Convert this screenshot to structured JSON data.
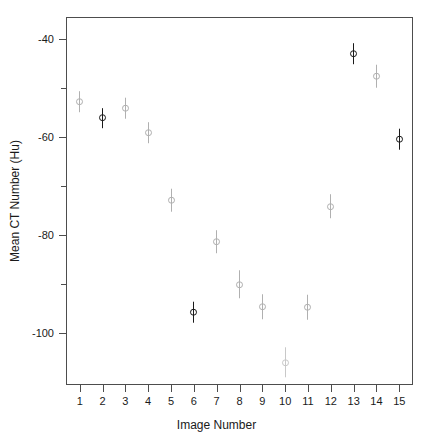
{
  "chart_data": {
    "type": "scatter",
    "title": "",
    "xlabel": "Image Number",
    "ylabel": "Mean CT Number (Hu)",
    "grid": false,
    "legend": null,
    "xlim": [
      0.4,
      15.6
    ],
    "ylim": [
      -110.5,
      -35.5
    ],
    "x_tick_labels": [
      "1",
      "2",
      "3",
      "4",
      "5",
      "6",
      "7",
      "8",
      "9",
      "10",
      "11",
      "12",
      "13",
      "14",
      "15"
    ],
    "x_ticks": [
      1,
      2,
      3,
      4,
      5,
      6,
      7,
      8,
      9,
      10,
      11,
      12,
      13,
      14,
      15
    ],
    "y_tick_labels": [
      "-40",
      "",
      "-60",
      "",
      "-80",
      "",
      "-100"
    ],
    "y_ticks": [
      -40,
      -50,
      -60,
      -70,
      -80,
      -90,
      -100
    ],
    "marker": "open-circle-with-errorbar",
    "x": [
      1,
      2,
      3,
      4,
      5,
      6,
      7,
      8,
      9,
      10,
      11,
      12,
      13,
      14,
      15
    ],
    "values": [
      -52.8,
      -56.1,
      -54.1,
      -59.1,
      -72.8,
      -95.7,
      -81.3,
      -90.0,
      -94.6,
      -105.9,
      -94.6,
      -74.1,
      -43.0,
      -47.6,
      -60.4
    ],
    "yerr": [
      2.2,
      2.0,
      2.1,
      2.2,
      2.3,
      2.1,
      2.4,
      2.8,
      2.6,
      3.0,
      2.5,
      2.4,
      2.2,
      2.3,
      2.1
    ],
    "point_colors": [
      "#b0b0b0",
      "#1a1a1a",
      "#b0b0b0",
      "#b0b0b0",
      "#b0b0b0",
      "#1a1a1a",
      "#b0b0b0",
      "#b0b0b0",
      "#b0b0b0",
      "#c8c8c8",
      "#b0b0b0",
      "#b0b0b0",
      "#1a1a1a",
      "#b0b0b0",
      "#1a1a1a"
    ],
    "axis_color": "#4d4d4d",
    "text_color": "#1a1a1a",
    "background": "#ffffff"
  }
}
